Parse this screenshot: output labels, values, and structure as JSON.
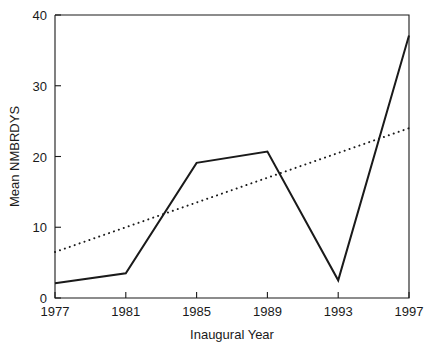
{
  "chart_data": {
    "type": "line",
    "title": "",
    "xlabel": "Inaugural Year",
    "ylabel": "Mean NMBRDYS",
    "xlim": [
      1977,
      1997
    ],
    "ylim": [
      0,
      40
    ],
    "xticks": [
      1977,
      1981,
      1985,
      1989,
      1993,
      1997
    ],
    "xticklabels": [
      "1977",
      "1981",
      "1985",
      "1989",
      "1993",
      "1997"
    ],
    "yticks": [
      0,
      10,
      20,
      30,
      40
    ],
    "yticklabels": [
      "0",
      "10",
      "20",
      "30",
      "40"
    ],
    "grid": false,
    "legend": null,
    "x": [
      1977,
      1981,
      1985,
      1989,
      1993,
      1997
    ],
    "series": [
      {
        "name": "Mean NMBRDYS",
        "style": "solid",
        "color": "#1a1a1a",
        "values": [
          2.1,
          3.5,
          19.1,
          20.7,
          2.5,
          37.1
        ]
      },
      {
        "name": "Trend",
        "style": "dotted",
        "color": "#1a1a1a",
        "x": [
          1977,
          1997
        ],
        "values": [
          6.5,
          24.0
        ]
      }
    ]
  },
  "axis": {
    "x_label": "Inaugural Year",
    "y_label": "Mean NMBRDYS",
    "y_tick_0": "0",
    "y_tick_1": "10",
    "y_tick_2": "20",
    "y_tick_3": "30",
    "y_tick_4": "40",
    "x_tick_0": "1977",
    "x_tick_1": "1981",
    "x_tick_2": "1985",
    "x_tick_3": "1989",
    "x_tick_4": "1993",
    "x_tick_5": "1997"
  }
}
